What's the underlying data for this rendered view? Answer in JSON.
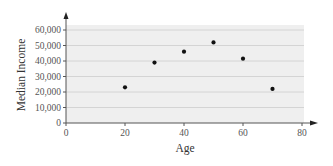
{
  "chart_data": {
    "type": "scatter",
    "title": "",
    "xlabel": "Age",
    "ylabel": "Median Income",
    "xlim": [
      0,
      80
    ],
    "ylim": [
      0,
      60000
    ],
    "x_ticks": [
      0,
      20,
      40,
      60,
      80
    ],
    "x_tick_labels": [
      "0",
      "20",
      "40",
      "60",
      "80"
    ],
    "y_ticks": [
      0,
      10000,
      20000,
      30000,
      40000,
      50000,
      60000
    ],
    "y_tick_labels": [
      "0",
      "10,000",
      "20,000",
      "30,000",
      "40,000",
      "50,000",
      "60,000"
    ],
    "grid": "horizontal",
    "legend": null,
    "series": [
      {
        "name": "Median Income by Age",
        "points": [
          {
            "x": 20,
            "y": 23000
          },
          {
            "x": 30,
            "y": 39000
          },
          {
            "x": 40,
            "y": 46000
          },
          {
            "x": 50,
            "y": 52000
          },
          {
            "x": 60,
            "y": 41500
          },
          {
            "x": 70,
            "y": 22000
          }
        ]
      }
    ],
    "colors": {
      "plot_background": "#efefef",
      "gridline": "#d4d4d4",
      "axis": "#555555",
      "point": "#111111"
    }
  }
}
